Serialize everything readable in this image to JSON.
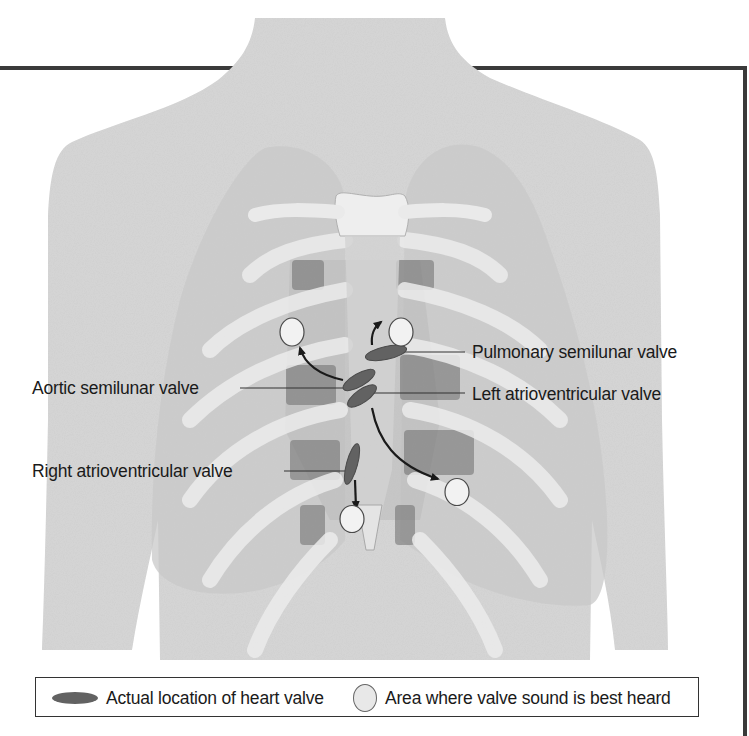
{
  "diagram": {
    "labels": {
      "pulmonary": "Pulmonary semilunar valve",
      "aortic": "Aortic semilunar valve",
      "left_av": "Left atrioventricular valve",
      "right_av": "Right atrioventricular valve"
    },
    "legend": {
      "valve_marker": "Actual location of heart valve",
      "area_marker": "Area where valve sound is best heard"
    },
    "colors": {
      "valve": "#626262",
      "auscultation_area": "#f0f0f0",
      "body": "#d4d4d4",
      "lung": "#c6c6c6",
      "frame": "#3a3a3a"
    }
  }
}
